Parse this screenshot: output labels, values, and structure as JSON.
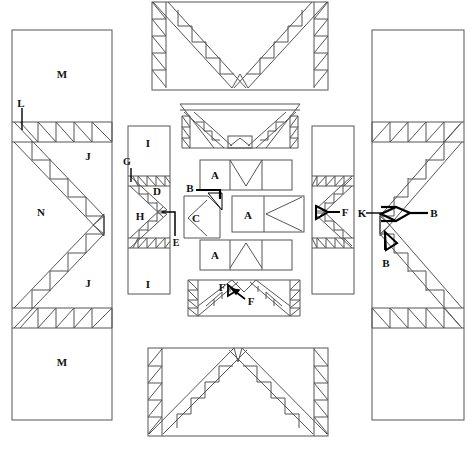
{
  "diagram": {
    "stroke_color": "#4a4a4a",
    "heavy_color": "#000000",
    "background": "#ffffff",
    "canvas": {
      "width": 476,
      "height": 449
    }
  },
  "zone_labels": {
    "left_panel": {
      "top_field": "M",
      "upper_band": "J",
      "center_field": "N",
      "lower_band": "J",
      "bottom_field": "M",
      "pointer": "L"
    },
    "inner_left_column": {
      "top_field": "I",
      "upper_band": "D",
      "center_field": "H",
      "bottom_field": "I",
      "pointer_top": "G",
      "pointer_bottom": "E"
    },
    "inner_right_column": {
      "pointer": "F"
    },
    "right_panel": {
      "pointer_left": "K",
      "pointer_right": "B",
      "pointer_lower": "B"
    },
    "core_modules": {
      "top_bay": "A",
      "middle_left_bay": "C",
      "middle_right_bay": "A",
      "bottom_bay": "A",
      "middle_pointer": "B"
    },
    "bottom_center_truss": {
      "pointer_left": "F",
      "pointer_right": "F"
    }
  },
  "legend_keys": [
    "A",
    "B",
    "C",
    "D",
    "E",
    "F",
    "G",
    "H",
    "I",
    "J",
    "K",
    "L",
    "M",
    "N"
  ]
}
